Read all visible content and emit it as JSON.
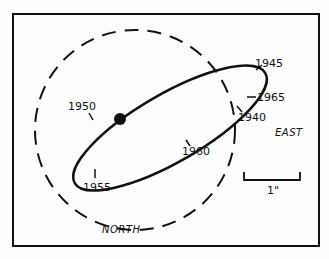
{
  "diagram": {
    "title": "",
    "frame": {
      "x": 13,
      "y": 14,
      "width": 306,
      "height": 232
    },
    "colors": {
      "ink": "#111111",
      "background": "#fdfdfb"
    },
    "dashed_circle": {
      "cx": 135,
      "cy": 130,
      "r": 100
    },
    "orbit_ellipse": {
      "cx": 170,
      "cy": 128,
      "rx": 110,
      "ry": 34,
      "rotation_deg": -30
    },
    "central_dot": {
      "cx": 120,
      "cy": 119,
      "r": 6
    },
    "year_labels": [
      {
        "text": "1945",
        "x": 255,
        "y": 67
      },
      {
        "text": "1965",
        "x": 257,
        "y": 100
      },
      {
        "text": "1940",
        "x": 238,
        "y": 121
      },
      {
        "text": "1950",
        "x": 68,
        "y": 110
      },
      {
        "text": "1960",
        "x": 182,
        "y": 154
      },
      {
        "text": "1955",
        "x": 83,
        "y": 191
      }
    ],
    "directions": {
      "north": "NORTH",
      "east": "EAST"
    },
    "scale_bar": {
      "label": "1\"",
      "x1": 244,
      "x2": 300,
      "y": 180
    }
  }
}
